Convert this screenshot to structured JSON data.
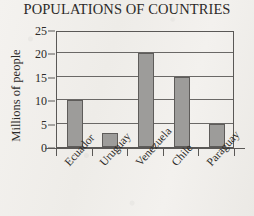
{
  "chart_data": {
    "type": "bar",
    "title": "POPULATIONS OF COUNTRIES",
    "xlabel": "",
    "ylabel": "Millions of people",
    "categories": [
      "Ecuador",
      "Uruguay",
      "Venezuela",
      "Chile",
      "Paraguay"
    ],
    "values": [
      10,
      3,
      20,
      15,
      5
    ],
    "ylim": [
      0,
      25
    ],
    "yticks": [
      0,
      5,
      10,
      15,
      20,
      25
    ],
    "ytick_labels": [
      "0",
      "5",
      "10",
      "15",
      "20",
      "25"
    ],
    "grid": "horizontal",
    "legend": "none",
    "bar_color": "#9d9c9a",
    "bar_edge_color": "#5e5c5a",
    "axis_color": "#5a5856",
    "background_color": "#f2f0ed",
    "text_color": "#2c2a28",
    "xtick_label_rotation": -48
  }
}
